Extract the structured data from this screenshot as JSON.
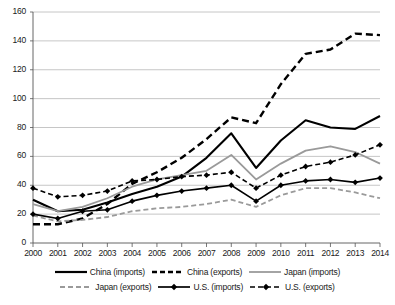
{
  "chart_data": {
    "type": "line",
    "title": "",
    "xlabel": "",
    "ylabel": "",
    "ylim": [
      0,
      160
    ],
    "ytick_step": 20,
    "grid": true,
    "legend_position": "bottom",
    "yticks": [
      "0",
      "20",
      "40",
      "60",
      "80",
      "100",
      "120",
      "140",
      "160"
    ],
    "categories": [
      "2000",
      "2001",
      "2002",
      "2003",
      "2004",
      "2005",
      "2006",
      "2007",
      "2008",
      "2009",
      "2010",
      "2011",
      "2012",
      "2013",
      "2014"
    ],
    "series": [
      {
        "name": "China (imports)",
        "style": "solid",
        "color": "#000000",
        "width": 2.1,
        "marker": "none",
        "values": [
          30,
          22,
          23,
          28,
          34,
          39,
          46,
          59,
          76,
          52,
          71,
          85,
          80,
          79,
          88
        ]
      },
      {
        "name": "China (exports)",
        "style": "dashed",
        "color": "#000000",
        "width": 2.4,
        "marker": "none",
        "values": [
          13,
          13,
          17,
          27,
          41,
          49,
          59,
          72,
          87,
          83,
          110,
          131,
          134,
          145,
          144
        ]
      },
      {
        "name": "Japan (imports)",
        "style": "solid",
        "color": "#9a9a9a",
        "width": 1.8,
        "marker": "none",
        "values": [
          27,
          22,
          25,
          31,
          39,
          44,
          47,
          50,
          61,
          44,
          55,
          64,
          67,
          63,
          55
        ]
      },
      {
        "name": "Japan (exports)",
        "style": "dashed",
        "color": "#9a9a9a",
        "width": 1.8,
        "marker": "none",
        "values": [
          19,
          15,
          16,
          18,
          22,
          24,
          25,
          27,
          30,
          25,
          33,
          38,
          38,
          35,
          31
        ]
      },
      {
        "name": "U.S. (imports)",
        "style": "solid",
        "color": "#000000",
        "width": 1.6,
        "marker": "diamond",
        "values": [
          20,
          17,
          22,
          23,
          29,
          33,
          36,
          38,
          40,
          29,
          40,
          43,
          44,
          42,
          45
        ]
      },
      {
        "name": "U.S. (exports)",
        "style": "dashed",
        "color": "#000000",
        "width": 1.6,
        "marker": "diamond",
        "values": [
          38,
          32,
          33,
          36,
          43,
          44,
          46,
          47,
          49,
          38,
          47,
          53,
          56,
          61,
          68
        ]
      }
    ]
  },
  "legend": {
    "rows": [
      [
        {
          "label": "China (imports)",
          "swatch": "solid-black-bold"
        },
        {
          "label": "China (exports)",
          "swatch": "dashed-black-bold"
        },
        {
          "label": "Japan (imports)",
          "swatch": "solid-gray"
        }
      ],
      [
        {
          "label": "Japan (exports)",
          "swatch": "dashed-gray"
        },
        {
          "label": "U.S. (imports)",
          "swatch": "solid-black-diamond"
        },
        {
          "label": "U.S. (exports)",
          "swatch": "dashed-black-diamond"
        }
      ]
    ]
  }
}
